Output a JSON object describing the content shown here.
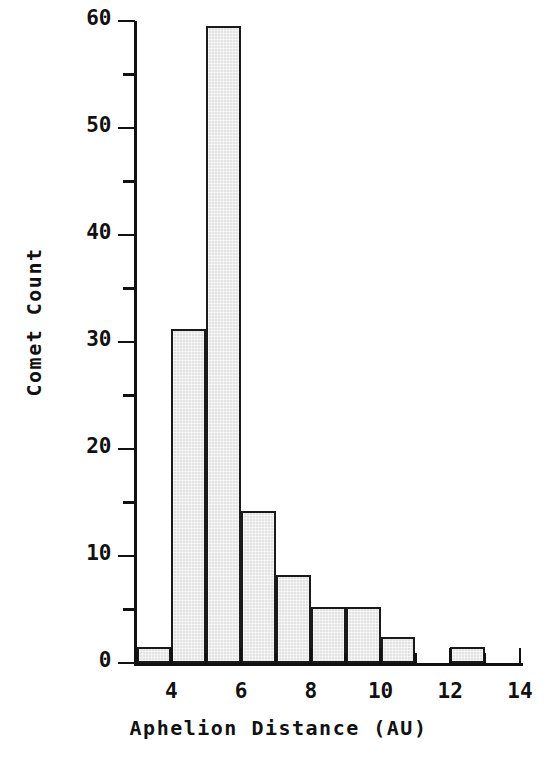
{
  "chart_data": {
    "type": "bar",
    "title": "",
    "subtitle": "",
    "xlabel": "Aphelion Distance  (AU)",
    "ylabel": "Comet Count",
    "xlim": [
      3,
      14
    ],
    "ylim": [
      0,
      60
    ],
    "grid": false,
    "legend": null,
    "bin_width": 1,
    "bin_edges": [
      3,
      4,
      5,
      6,
      7,
      8,
      9,
      10,
      11,
      12,
      13,
      14
    ],
    "categories": [
      "3-4",
      "4-5",
      "5-6",
      "6-7",
      "7-8",
      "8-9",
      "9-10",
      "10-11",
      "11-12",
      "12-13",
      "13-14"
    ],
    "values": [
      1.5,
      31.2,
      59.5,
      14.2,
      8.2,
      5.2,
      5.2,
      2.4,
      0,
      1.5,
      0
    ],
    "x_ticks": [
      4,
      6,
      8,
      10,
      12,
      14
    ],
    "x_tick_labels": [
      "4",
      "6",
      "8",
      "10",
      "12",
      "14"
    ],
    "x_minor_ticks": [
      3,
      5,
      7,
      9,
      11,
      13
    ],
    "y_ticks": [
      0,
      10,
      20,
      30,
      40,
      50,
      60
    ],
    "y_tick_labels": [
      "0",
      "10",
      "20",
      "30",
      "40",
      "50",
      "60"
    ],
    "y_minor_ticks": [
      5,
      15,
      25,
      35,
      45,
      55
    ],
    "colors": {
      "bar_fill": "#e3e3e3",
      "bar_edge": "#1a1a1a",
      "axis": "#111111",
      "text": "#111111",
      "background": "#ffffff"
    }
  }
}
